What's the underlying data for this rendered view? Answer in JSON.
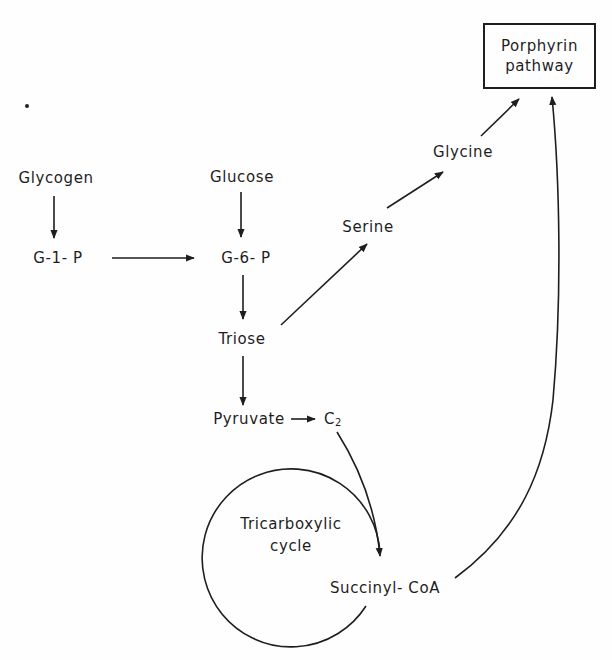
{
  "diagram": {
    "target": {
      "line1": "Porphyrin",
      "line2": "pathway"
    },
    "nodes": {
      "glycogen": "Glycogen",
      "glucose": "Glucose",
      "g1p": "G-1- P",
      "g6p": "G-6- P",
      "triose": "Triose",
      "pyruvate": "Pyruvate",
      "c2_base": "C",
      "c2_sub": "2",
      "serine": "Serine",
      "glycine": "Glycine",
      "succinyl_coa": "Succinyl- CoA"
    },
    "cycle": {
      "line1": "Tricarboxylic",
      "line2": "cycle"
    },
    "edges": [
      {
        "from": "Glycogen",
        "to": "G-1-P"
      },
      {
        "from": "Glucose",
        "to": "G-6-P"
      },
      {
        "from": "G-1-P",
        "to": "G-6-P"
      },
      {
        "from": "G-6-P",
        "to": "Triose"
      },
      {
        "from": "Triose",
        "to": "Pyruvate"
      },
      {
        "from": "Pyruvate",
        "to": "C2"
      },
      {
        "from": "C2",
        "to": "Succinyl-CoA"
      },
      {
        "from": "Triose",
        "to": "Serine"
      },
      {
        "from": "Serine",
        "to": "Glycine"
      },
      {
        "from": "Glycine",
        "to": "Porphyrin pathway"
      },
      {
        "from": "Succinyl-CoA",
        "to": "Porphyrin pathway"
      },
      {
        "from": "Tricarboxylic cycle",
        "to": "Succinyl-CoA"
      }
    ],
    "colors": {
      "ink": "#1e1e1e",
      "background": "#fefefe"
    }
  }
}
